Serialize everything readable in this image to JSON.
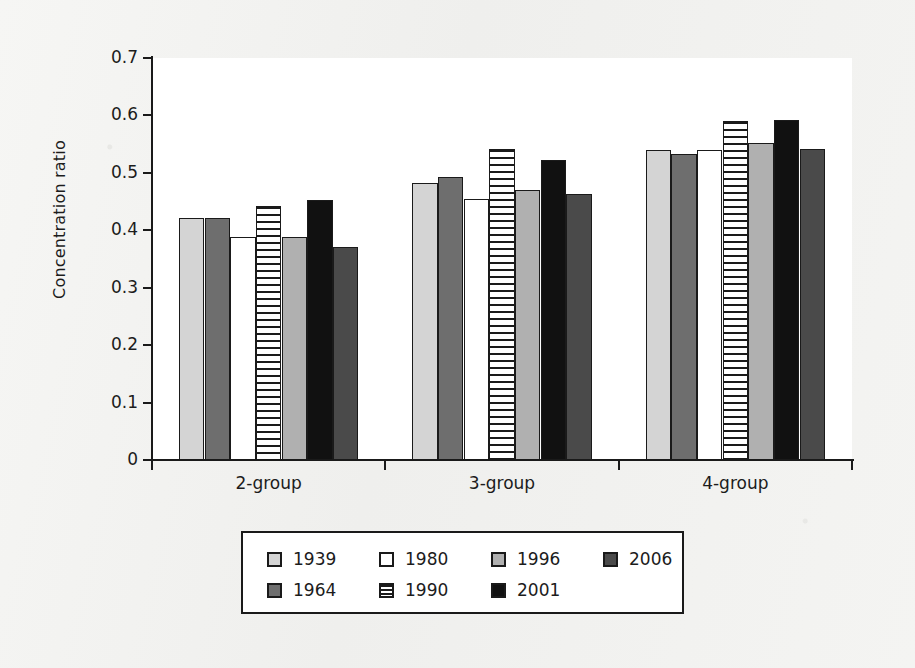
{
  "chart_data": {
    "type": "bar",
    "title": "",
    "xlabel": "",
    "ylabel": "Concentration ratio",
    "categories": [
      "2-group",
      "3-group",
      "4-group"
    ],
    "ylim": [
      0,
      0.7
    ],
    "ytick_labels": [
      "0.7",
      "0.6",
      "0.5",
      "0.4",
      "0.3",
      "0.2",
      "0.1",
      "0"
    ],
    "ytick_values": [
      0.7,
      0.6,
      0.5,
      0.4,
      0.3,
      0.2,
      0.1,
      0
    ],
    "grid": false,
    "legend_position": "bottom-center",
    "series": [
      {
        "name": "1939",
        "color": "#d4d4d4",
        "pattern": "solid",
        "values": [
          0.422,
          0.482,
          0.54
        ]
      },
      {
        "name": "1964",
        "color": "#6e6e6e",
        "pattern": "solid",
        "values": [
          0.422,
          0.493,
          0.533
        ]
      },
      {
        "name": "1980",
        "color": "#ffffff",
        "pattern": "solid",
        "values": [
          0.389,
          0.455,
          0.54
        ]
      },
      {
        "name": "1990",
        "color": "#ffffff",
        "pattern": "horizontal-lines",
        "values": [
          0.442,
          0.541,
          0.591
        ]
      },
      {
        "name": "1996",
        "color": "#b0b0b0",
        "pattern": "solid",
        "values": [
          0.389,
          0.471,
          0.552
        ]
      },
      {
        "name": "2001",
        "color": "#111111",
        "pattern": "solid",
        "values": [
          0.453,
          0.522,
          0.592
        ]
      },
      {
        "name": "2006",
        "color": "#4a4a4a",
        "pattern": "solid",
        "values": [
          0.371,
          0.463,
          0.541
        ]
      }
    ]
  },
  "legend": {
    "order": [
      "1939",
      "1980",
      "1996",
      "2006",
      "1964",
      "1990",
      "2001"
    ]
  },
  "colors": {
    "axis": "#1a1a1a",
    "plot_background": "#ffffff",
    "page_background": "#f2f2f0"
  }
}
